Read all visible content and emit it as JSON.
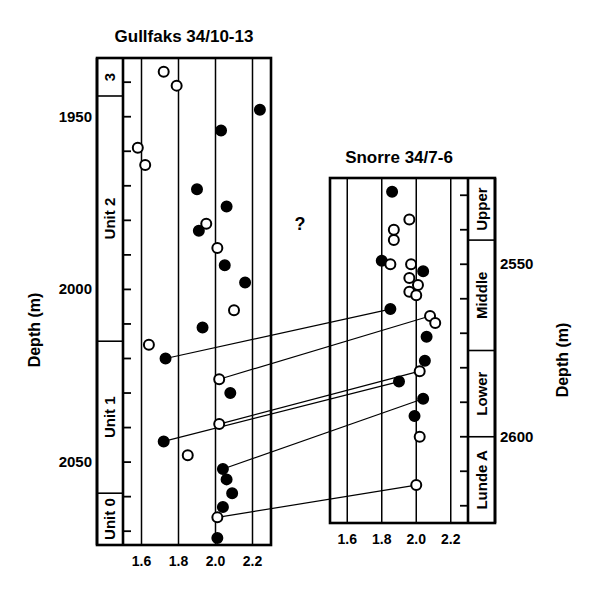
{
  "figure": {
    "background_color": "#ffffff",
    "ink_color": "#000000",
    "y_axis_title_left": "Depth (m)",
    "y_axis_title_right": "Depth (m)",
    "uncertainty_marker": "?"
  },
  "chart_data": {
    "type": "scatter",
    "xlabel": "",
    "ylabel": "Depth (m)",
    "grid": true,
    "legend_position": "none",
    "series_definitions": [
      {
        "name": "filled-circle",
        "marker": "filled circle",
        "color": "#000000"
      },
      {
        "name": "open-circle",
        "marker": "open circle",
        "color": "#ffffff"
      }
    ],
    "panels": [
      {
        "id": "gullfaks",
        "title": "Gullfaks 34/10-13",
        "xlim": [
          1.5,
          2.3
        ],
        "xticks": [
          1.6,
          1.8,
          2.0,
          2.2
        ],
        "xtick_labels": [
          "1.6",
          "1.8",
          "2.0",
          "2.2"
        ],
        "gridline_values": [
          1.5,
          1.6,
          1.8,
          2.0,
          2.2,
          2.3
        ],
        "ylim": [
          1933,
          2074
        ],
        "yticks": [
          1950,
          2000,
          2050
        ],
        "ytick_labels": [
          "1950",
          "2000",
          "2050"
        ],
        "minor_tick_interval": 10,
        "units": [
          {
            "label": "3",
            "top": 1933,
            "bottom": 1944
          },
          {
            "label": "Unit 2",
            "top": 1944,
            "bottom": 2015
          },
          {
            "label": "Unit 1",
            "top": 2015,
            "bottom": 2059
          },
          {
            "label": "Unit 0",
            "top": 2059,
            "bottom": 2074
          }
        ],
        "points": [
          {
            "x": 1.72,
            "y": 1937,
            "type": "open-circle"
          },
          {
            "x": 1.79,
            "y": 1941,
            "type": "open-circle"
          },
          {
            "x": 2.24,
            "y": 1948,
            "type": "filled-circle"
          },
          {
            "x": 2.03,
            "y": 1954,
            "type": "filled-circle"
          },
          {
            "x": 1.58,
            "y": 1959,
            "type": "open-circle"
          },
          {
            "x": 1.62,
            "y": 1964,
            "type": "open-circle"
          },
          {
            "x": 1.9,
            "y": 1971,
            "type": "filled-circle"
          },
          {
            "x": 2.06,
            "y": 1976,
            "type": "filled-circle"
          },
          {
            "x": 1.95,
            "y": 1981,
            "type": "open-circle"
          },
          {
            "x": 1.91,
            "y": 1983,
            "type": "filled-circle"
          },
          {
            "x": 2.01,
            "y": 1988,
            "type": "open-circle"
          },
          {
            "x": 2.05,
            "y": 1993,
            "type": "filled-circle"
          },
          {
            "x": 2.16,
            "y": 1998,
            "type": "filled-circle"
          },
          {
            "x": 2.1,
            "y": 2006,
            "type": "open-circle"
          },
          {
            "x": 1.93,
            "y": 2011,
            "type": "filled-circle"
          },
          {
            "x": 1.64,
            "y": 2016,
            "type": "open-circle"
          },
          {
            "x": 1.73,
            "y": 2020,
            "type": "filled-circle"
          },
          {
            "x": 2.02,
            "y": 2026,
            "type": "open-circle"
          },
          {
            "x": 2.08,
            "y": 2030,
            "type": "filled-circle"
          },
          {
            "x": 2.02,
            "y": 2039,
            "type": "open-circle"
          },
          {
            "x": 1.72,
            "y": 2044,
            "type": "filled-circle"
          },
          {
            "x": 1.85,
            "y": 2048,
            "type": "open-circle"
          },
          {
            "x": 2.04,
            "y": 2052,
            "type": "filled-circle"
          },
          {
            "x": 2.06,
            "y": 2055,
            "type": "filled-circle"
          },
          {
            "x": 2.09,
            "y": 2059,
            "type": "filled-circle"
          },
          {
            "x": 2.04,
            "y": 2063,
            "type": "filled-circle"
          },
          {
            "x": 2.01,
            "y": 2066,
            "type": "open-circle"
          },
          {
            "x": 2.01,
            "y": 2072,
            "type": "filled-circle"
          }
        ]
      },
      {
        "id": "snorre",
        "title": "Snorre 34/7-6",
        "xlim": [
          1.5,
          2.3
        ],
        "xticks": [
          1.6,
          1.8,
          2.0,
          2.2
        ],
        "xtick_labels": [
          "1.6",
          "1.8",
          "2.0",
          "2.2"
        ],
        "gridline_values": [
          1.5,
          1.6,
          1.8,
          2.0,
          2.2,
          2.3
        ],
        "ylim": [
          2525,
          2625
        ],
        "yticks": [
          2550,
          2600
        ],
        "ytick_labels": [
          "2550",
          "2600"
        ],
        "minor_tick_interval": 10,
        "units": [
          {
            "label": "Upper",
            "top": 2525,
            "bottom": 2543
          },
          {
            "label": "Middle",
            "top": 2543,
            "bottom": 2575
          },
          {
            "label": "Lower",
            "top": 2575,
            "bottom": 2600
          },
          {
            "label": "Lunde A",
            "top": 2600,
            "bottom": 2625
          }
        ],
        "points": [
          {
            "x": 1.86,
            "y": 2529,
            "type": "filled-circle"
          },
          {
            "x": 1.96,
            "y": 2537,
            "type": "open-circle"
          },
          {
            "x": 1.87,
            "y": 2540,
            "type": "open-circle"
          },
          {
            "x": 1.87,
            "y": 2543,
            "type": "open-circle"
          },
          {
            "x": 1.8,
            "y": 2549,
            "type": "filled-circle"
          },
          {
            "x": 1.85,
            "y": 2550,
            "type": "open-circle"
          },
          {
            "x": 1.97,
            "y": 2550,
            "type": "open-circle"
          },
          {
            "x": 2.04,
            "y": 2552,
            "type": "filled-circle"
          },
          {
            "x": 1.96,
            "y": 2554,
            "type": "open-circle"
          },
          {
            "x": 2.01,
            "y": 2556,
            "type": "open-circle"
          },
          {
            "x": 1.96,
            "y": 2558,
            "type": "open-circle"
          },
          {
            "x": 2.0,
            "y": 2559,
            "type": "open-circle"
          },
          {
            "x": 1.85,
            "y": 2563,
            "type": "filled-circle"
          },
          {
            "x": 2.08,
            "y": 2565,
            "type": "open-circle"
          },
          {
            "x": 2.11,
            "y": 2567,
            "type": "open-circle"
          },
          {
            "x": 2.06,
            "y": 2571,
            "type": "filled-circle"
          },
          {
            "x": 2.05,
            "y": 2578,
            "type": "filled-circle"
          },
          {
            "x": 2.02,
            "y": 2581,
            "type": "open-circle"
          },
          {
            "x": 1.9,
            "y": 2584,
            "type": "filled-circle"
          },
          {
            "x": 2.04,
            "y": 2589,
            "type": "filled-circle"
          },
          {
            "x": 1.99,
            "y": 2594,
            "type": "filled-circle"
          },
          {
            "x": 2.02,
            "y": 2600,
            "type": "open-circle"
          },
          {
            "x": 2.0,
            "y": 2614,
            "type": "open-circle"
          }
        ]
      }
    ],
    "correlation_lines": [
      {
        "from_panel": "gullfaks",
        "from_x": 1.73,
        "from_y": 2020,
        "to_panel": "snorre",
        "to_x": 1.85,
        "to_y": 2563
      },
      {
        "from_panel": "gullfaks",
        "from_x": 2.02,
        "from_y": 2026,
        "to_panel": "snorre",
        "to_x": 2.08,
        "to_y": 2565
      },
      {
        "from_panel": "gullfaks",
        "from_x": 2.02,
        "from_y": 2039,
        "to_panel": "snorre",
        "to_x": 2.02,
        "to_y": 2581
      },
      {
        "from_panel": "gullfaks",
        "from_x": 1.72,
        "from_y": 2044,
        "to_panel": "snorre",
        "to_x": 1.9,
        "to_y": 2584
      },
      {
        "from_panel": "gullfaks",
        "from_x": 2.04,
        "from_y": 2052,
        "to_panel": "snorre",
        "to_x": 2.04,
        "to_y": 2589
      },
      {
        "from_panel": "gullfaks",
        "from_x": 2.01,
        "from_y": 2066,
        "to_panel": "snorre",
        "to_x": 2.0,
        "to_y": 2614
      }
    ]
  }
}
